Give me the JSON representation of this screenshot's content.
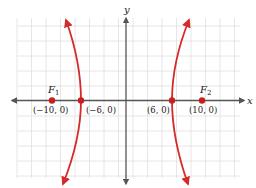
{
  "diagram": {
    "axes": {
      "x_label": "x",
      "y_label": "y"
    },
    "colors": {
      "curve": "#d42a2a",
      "axis": "#555555",
      "grid": "#dddddd",
      "point": "#c8201e"
    },
    "foci": [
      {
        "name": "F1",
        "label_main": "F",
        "label_sub": "1",
        "coord": "(−10, 0)",
        "x": -10,
        "y": 0
      },
      {
        "name": "F2",
        "label_main": "F",
        "label_sub": "2",
        "coord": "(10, 0)",
        "x": 10,
        "y": 0
      }
    ],
    "vertices": [
      {
        "coord": "(−6, 0)",
        "x": -6,
        "y": 0
      },
      {
        "coord": "(6, 0)",
        "x": 6,
        "y": 0
      }
    ]
  }
}
